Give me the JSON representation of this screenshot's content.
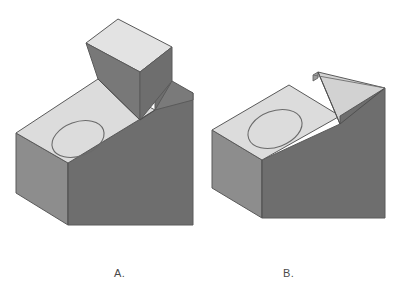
{
  "figure": {
    "type": "technical-isometric-diagram",
    "background_color": "#ffffff",
    "width": 404,
    "height": 303
  },
  "palette": {
    "top_face": "#dcdcdc",
    "top_face_light": "#e3e3e3",
    "left_face": "#8d8d8d",
    "right_face": "#6e6e6e",
    "notch_face": "#9c9c9c",
    "edge_line": "#5a5a5a",
    "hole_line": "#6a6a6a",
    "label_color": "#4a4a4a"
  },
  "objects": [
    {
      "id": "A",
      "label": "A.",
      "label_x": 114,
      "label_y": 267,
      "description": "Rectangular block with elliptical hole on top face and a raised rectangular boss at the rear-right",
      "features": [
        "elliptical-hole",
        "raised-rectangular-boss"
      ],
      "hole": {
        "cx": 78,
        "cy": 139,
        "rx": 27,
        "ry": 17,
        "rotation": -20
      }
    },
    {
      "id": "B",
      "label": "B.",
      "label_x": 283,
      "label_y": 267,
      "description": "Rectangular block with elliptical hole on top face and a V-notch slot cut into the right side",
      "features": [
        "elliptical-hole",
        "v-notch-slot"
      ],
      "hole": {
        "cx": 275,
        "cy": 129,
        "rx": 28,
        "ry": 18,
        "rotation": -20
      }
    }
  ],
  "labels": {
    "a": "A.",
    "b": "B."
  }
}
